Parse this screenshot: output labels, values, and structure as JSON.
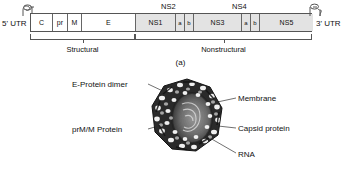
{
  "figure": {
    "panels": [
      {
        "caption": "(a)"
      },
      {
        "caption": "(b)"
      }
    ]
  },
  "panel_a": {
    "name": "genome-organization",
    "utr_5_label": "5' UTR",
    "utr_3_label": "3' UTR",
    "stemloop_5_name": "5-prime-stem-loop",
    "stemloop_3_name": "3-prime-stem-loop",
    "genes": [
      {
        "label": "C",
        "region": "structural",
        "width": 22
      },
      {
        "label": "pr",
        "region": "structural",
        "width": 15
      },
      {
        "label": "M",
        "region": "structural",
        "width": 14
      },
      {
        "label": "E",
        "region": "structural",
        "width": 54
      },
      {
        "label": "NS1",
        "region": "nonstructural",
        "width": 40
      },
      {
        "label": "a",
        "region": "nonstructural",
        "width": 9
      },
      {
        "label": "b",
        "region": "nonstructural",
        "width": 9
      },
      {
        "label": "NS3",
        "region": "nonstructural",
        "width": 48
      },
      {
        "label": "a",
        "region": "nonstructural",
        "width": 9
      },
      {
        "label": "b",
        "region": "nonstructural",
        "width": 9
      },
      {
        "label": "NS5",
        "region": "nonstructural",
        "width": 53
      }
    ],
    "group_labels": {
      "ns2": "NS2",
      "ns4": "NS4"
    },
    "brackets": [
      {
        "label": "Structural"
      },
      {
        "label": "Nonstructural"
      }
    ]
  },
  "panel_b": {
    "name": "virion-structure",
    "callouts": [
      {
        "id": "e-protein-dimer",
        "label": "E-Protein dimer"
      },
      {
        "id": "prm-m-protein",
        "label": "prM/M Protein"
      },
      {
        "id": "membrane",
        "label": "Membrane"
      },
      {
        "id": "capsid-protein",
        "label": "Capsid protein"
      },
      {
        "id": "rna",
        "label": "RNA"
      }
    ]
  },
  "colors": {
    "structural_fill": "#ffffff",
    "nonstructural_fill": "#e3e3e3",
    "outline": "#555555",
    "text": "#1a1a1a"
  }
}
